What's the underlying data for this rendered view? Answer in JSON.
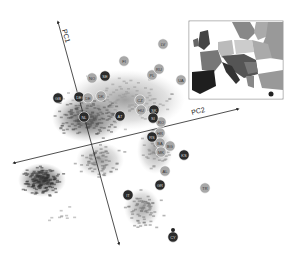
{
  "chart_data": {
    "type": "scatter",
    "title": "",
    "axes": [
      {
        "name": "PC1",
        "label": "PC1",
        "direction": "up-left"
      },
      {
        "name": "PC2",
        "label": "PC2",
        "direction": "right"
      }
    ],
    "grid": false,
    "legend": "inset map of Europe (top-right) shading countries by group",
    "colors": {
      "dark": "#2b2b2b",
      "mid": "#6e6e6e",
      "light": "#a8a8a8",
      "pale": "#cfcfcf"
    },
    "population_means": [
      {
        "label": "FI",
        "x": 124,
        "y": 61,
        "shade": "light"
      },
      {
        "label": "LV",
        "x": 163,
        "y": 44,
        "shade": "light"
      },
      {
        "label": "PL",
        "x": 152,
        "y": 75,
        "shade": "light"
      },
      {
        "label": "RU",
        "x": 159,
        "y": 69,
        "shade": "light"
      },
      {
        "label": "UA",
        "x": 181,
        "y": 80,
        "shade": "light"
      },
      {
        "label": "NO",
        "x": 92,
        "y": 78,
        "shade": "light"
      },
      {
        "label": "SE",
        "x": 105,
        "y": 76,
        "shade": "dark"
      },
      {
        "label": "DK",
        "x": 101,
        "y": 96,
        "shade": "light"
      },
      {
        "label": "GB",
        "x": 58,
        "y": 98,
        "shade": "dark"
      },
      {
        "label": "DE",
        "x": 79,
        "y": 97,
        "shade": "dark"
      },
      {
        "label": "DE",
        "x": 88,
        "y": 98,
        "shade": "light"
      },
      {
        "label": "NL",
        "x": 84,
        "y": 117,
        "shade": "dark"
      },
      {
        "label": "AT",
        "x": 120,
        "y": 116,
        "shade": "dark"
      },
      {
        "label": "CZ",
        "x": 140,
        "y": 100,
        "shade": "light"
      },
      {
        "label": "HU",
        "x": 141,
        "y": 110,
        "shade": "light"
      },
      {
        "label": "SK",
        "x": 154,
        "y": 110,
        "shade": "dark"
      },
      {
        "label": "RO",
        "x": 161,
        "y": 122,
        "shade": "light"
      },
      {
        "label": "SI",
        "x": 153,
        "y": 118,
        "shade": "dark"
      },
      {
        "label": "HR",
        "x": 160,
        "y": 133,
        "shade": "light"
      },
      {
        "label": "BA",
        "x": 160,
        "y": 143,
        "shade": "light"
      },
      {
        "label": "RS",
        "x": 152,
        "y": 137,
        "shade": "dark"
      },
      {
        "label": "MK",
        "x": 161,
        "y": 152,
        "shade": "light"
      },
      {
        "label": "BG",
        "x": 170,
        "y": 146,
        "shade": "light"
      },
      {
        "label": "KS",
        "x": 184,
        "y": 155,
        "shade": "dark"
      },
      {
        "label": "AL",
        "x": 165,
        "y": 171,
        "shade": "light"
      },
      {
        "label": "GR",
        "x": 160,
        "y": 185,
        "shade": "dark"
      },
      {
        "label": "TR",
        "x": 205,
        "y": 188,
        "shade": "light"
      },
      {
        "label": "IT",
        "x": 128,
        "y": 195,
        "shade": "dark"
      },
      {
        "label": "CY",
        "x": 173,
        "y": 237,
        "shade": "dark"
      }
    ],
    "clusters": [
      {
        "name": "Iberia",
        "label": "ES/PT",
        "cx": 42,
        "cy": 180,
        "rx": 22,
        "ry": 16
      },
      {
        "name": "NW Europe",
        "label": "FR/DE/CH",
        "cx": 90,
        "cy": 118,
        "rx": 28,
        "ry": 20
      },
      {
        "name": "Italy",
        "label": "IT",
        "cx": 100,
        "cy": 160,
        "rx": 22,
        "ry": 16
      },
      {
        "name": "Southern Italy",
        "label": "IT",
        "cx": 140,
        "cy": 205,
        "rx": 18,
        "ry": 18
      }
    ]
  },
  "axes": {
    "pc1_label": "PC1",
    "pc2_label": "PC2"
  },
  "inset_map": {
    "title": "Europe",
    "codes": [
      "GB",
      "IE",
      "FR",
      "DE",
      "PL",
      "ES",
      "IT",
      "AT",
      "CZ",
      "HU",
      "RO",
      "UA",
      "RU",
      "BY",
      "NO",
      "SE",
      "FI",
      "TR",
      "GR"
    ]
  }
}
